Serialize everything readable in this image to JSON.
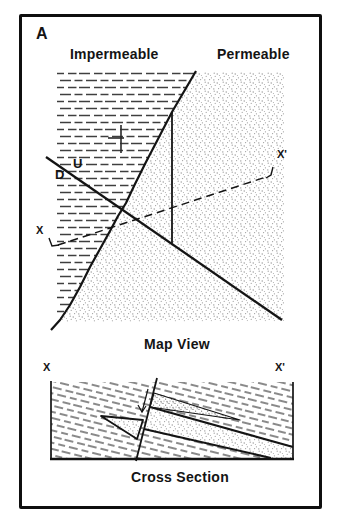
{
  "figure": {
    "panel_label": "A",
    "map_view": {
      "left_unit": "Impermeable",
      "right_unit": "Permeable",
      "fault_up_label": "U",
      "fault_down_label": "D",
      "section_start_label": "X",
      "section_end_label": "X'",
      "caption": "Map View"
    },
    "cross_section": {
      "start_label": "X",
      "end_label": "X'",
      "caption": "Cross Section"
    }
  },
  "icons": {
    "strike_dip": "strike-dip-symbol",
    "fault_motion": "downthrown-side-arrow"
  },
  "colors": {
    "ink": "#141414",
    "pattern_gray": "#8f8f8f",
    "background": "#ffffff"
  }
}
